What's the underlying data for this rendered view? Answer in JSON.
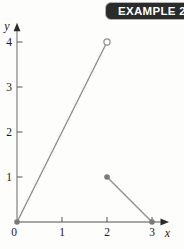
{
  "badge": {
    "label": "EXAMPLE 2",
    "bg_color": "#2b2b2b",
    "text_color": "#ffffff",
    "border_color": "#b4b4b4"
  },
  "chart_data": {
    "type": "line",
    "title": "",
    "xlabel": "x",
    "ylabel": "y",
    "origin_label": "0",
    "x_ticks": [
      1,
      2,
      3
    ],
    "y_ticks": [
      1,
      2,
      3,
      4
    ],
    "xlim": [
      0,
      3.3
    ],
    "ylim": [
      0,
      4.35
    ],
    "grid": false,
    "legend": false,
    "line_color": "#8f8f8f",
    "axis_color": "#8a8a8a",
    "tick_color": "#555555",
    "arrow_color": "#2b2b2b",
    "marker_color": "#7a7a7a",
    "label_color": "#1a1a1a",
    "segments": [
      {
        "from": [
          0,
          0
        ],
        "to": [
          2,
          4
        ],
        "from_marker": "filled",
        "to_marker": "open"
      },
      {
        "from": [
          2,
          1
        ],
        "to": [
          3,
          0
        ],
        "from_marker": "filled",
        "to_marker": "filled"
      }
    ]
  }
}
